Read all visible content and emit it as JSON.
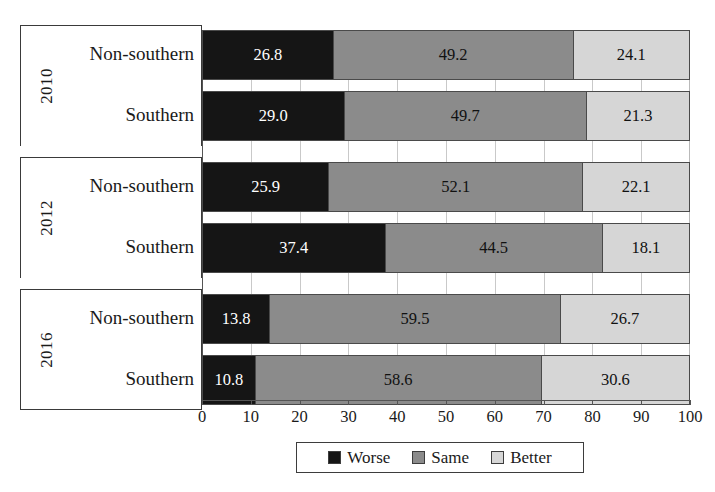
{
  "chart_data": {
    "type": "bar",
    "orientation": "horizontal",
    "stacked": true,
    "stack_normalized_percent": true,
    "title": "",
    "subtitle": "",
    "xlabel": "",
    "ylabel": "",
    "xlim": [
      0,
      100
    ],
    "xticks": [
      "0",
      "10",
      "20",
      "30",
      "40",
      "50",
      "60",
      "70",
      "80",
      "90",
      "100"
    ],
    "grid": true,
    "grid_axis": "x",
    "legend_position": "bottom-center",
    "legend": [
      "Worse",
      "Same",
      "Better"
    ],
    "colors": {
      "worse": "#151515",
      "same": "#8b8b8b",
      "better": "#d6d6d6",
      "frame": "#3a3a3a",
      "grid": "#c9c9c9"
    },
    "groups": [
      {
        "year": "2010",
        "rows": [
          {
            "region": "Non-southern",
            "values": [
              26.8,
              49.2,
              24.1
            ],
            "labels": [
              "26.8",
              "49.2",
              "24.1"
            ]
          },
          {
            "region": "Southern",
            "values": [
              29.0,
              49.7,
              21.3
            ],
            "labels": [
              "29.0",
              "49.7",
              "21.3"
            ]
          }
        ]
      },
      {
        "year": "2012",
        "rows": [
          {
            "region": "Non-southern",
            "values": [
              25.9,
              52.1,
              22.1
            ],
            "labels": [
              "25.9",
              "52.1",
              "22.1"
            ]
          },
          {
            "region": "Southern",
            "values": [
              37.4,
              44.5,
              18.1
            ],
            "labels": [
              "37.4",
              "44.5",
              "18.1"
            ]
          }
        ]
      },
      {
        "year": "2016",
        "rows": [
          {
            "region": "Non-southern",
            "values": [
              13.8,
              59.5,
              26.7
            ],
            "labels": [
              "13.8",
              "59.5",
              "26.7"
            ]
          },
          {
            "region": "Southern",
            "values": [
              10.8,
              58.6,
              30.6
            ],
            "labels": [
              "10.8",
              "58.6",
              "30.6"
            ]
          }
        ]
      }
    ],
    "series": [
      {
        "name": "Worse",
        "values": [
          26.8,
          29.0,
          25.9,
          37.4,
          13.8,
          10.8
        ]
      },
      {
        "name": "Same",
        "values": [
          49.2,
          49.7,
          52.1,
          44.5,
          59.5,
          58.6
        ]
      },
      {
        "name": "Better",
        "values": [
          24.1,
          21.3,
          22.1,
          18.1,
          26.7,
          30.6
        ]
      }
    ],
    "categories": [
      "2010 Non-southern",
      "2010 Southern",
      "2012 Non-southern",
      "2012 Southern",
      "2016 Non-southern",
      "2016 Southern"
    ]
  }
}
